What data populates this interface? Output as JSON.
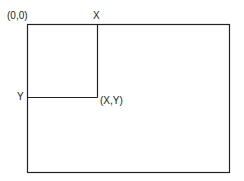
{
  "diagram": {
    "labels": {
      "origin": "(0,0)",
      "x": "X",
      "y": "Y",
      "point": "(X,Y)"
    },
    "colors": {
      "line": "#222222",
      "background": "#ffffff"
    }
  }
}
